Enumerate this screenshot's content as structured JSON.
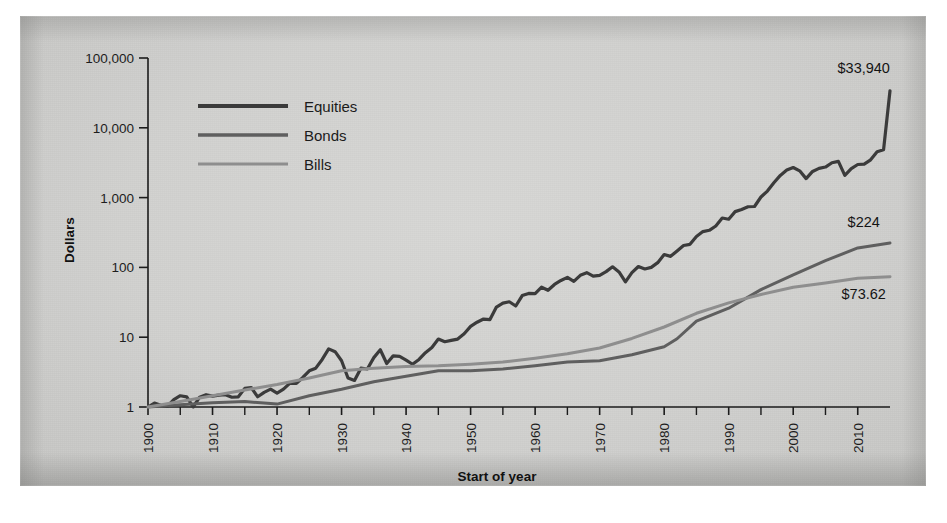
{
  "chart_data": {
    "type": "line",
    "title": "",
    "subtitle": "",
    "xlabel": "Start of year",
    "ylabel": "Dollars",
    "yscale": "log",
    "ylim": [
      1,
      100000
    ],
    "xlim": [
      1900,
      2015
    ],
    "grid": false,
    "legend_position": "upper-left-inside",
    "y_tick_labels": [
      "100,000",
      "10,000",
      "1,000",
      "100",
      "10",
      "1"
    ],
    "y_tick_values": [
      100000,
      10000,
      1000,
      100,
      10,
      1
    ],
    "x_tick_labels": [
      "1900",
      "1910",
      "1920",
      "1930",
      "1940",
      "1950",
      "1960",
      "1970",
      "1980",
      "1990",
      "2000",
      "2010"
    ],
    "x_tick_values": [
      1900,
      1910,
      1920,
      1930,
      1940,
      1950,
      1960,
      1970,
      1980,
      1990,
      2000,
      2010
    ],
    "x_minor_ticks": [
      1905,
      1915,
      1925,
      1935,
      1945,
      1955,
      1965,
      1975,
      1985,
      1995,
      2005
    ],
    "annotations": [
      {
        "label": "$33,940",
        "series": "Equities",
        "x": 2010,
        "value": 33940
      },
      {
        "label": "$224",
        "series": "Bonds",
        "x": 2010,
        "value": 224
      },
      {
        "label": "$73.62",
        "series": "Bills",
        "x": 2010,
        "value": 73.62
      }
    ],
    "series": [
      {
        "name": "Equities",
        "color": "#3b3b3b",
        "width": 3.2,
        "x": [
          1900,
          1901,
          1902,
          1903,
          1904,
          1905,
          1906,
          1907,
          1908,
          1909,
          1910,
          1911,
          1912,
          1913,
          1914,
          1915,
          1916,
          1917,
          1918,
          1919,
          1920,
          1921,
          1922,
          1923,
          1924,
          1925,
          1926,
          1927,
          1928,
          1929,
          1930,
          1931,
          1932,
          1933,
          1934,
          1935,
          1936,
          1937,
          1938,
          1939,
          1940,
          1941,
          1942,
          1943,
          1944,
          1945,
          1946,
          1947,
          1948,
          1949,
          1950,
          1951,
          1952,
          1953,
          1954,
          1955,
          1956,
          1957,
          1958,
          1959,
          1960,
          1961,
          1962,
          1963,
          1964,
          1965,
          1966,
          1967,
          1968,
          1969,
          1970,
          1971,
          1972,
          1973,
          1974,
          1975,
          1976,
          1977,
          1978,
          1979,
          1980,
          1981,
          1982,
          1983,
          1984,
          1985,
          1986,
          1987,
          1988,
          1989,
          1990,
          1991,
          1992,
          1993,
          1994,
          1995,
          1996,
          1997,
          1998,
          1999,
          2000,
          2001,
          2002,
          2003,
          2004,
          2005,
          2006,
          2007,
          2008,
          2009,
          2010,
          2011,
          2012,
          2013,
          2014,
          2015
        ],
        "values": [
          1,
          1.14,
          1.06,
          1.02,
          1.28,
          1.45,
          1.4,
          1.0,
          1.38,
          1.5,
          1.43,
          1.48,
          1.5,
          1.38,
          1.4,
          1.85,
          1.9,
          1.4,
          1.62,
          1.8,
          1.58,
          1.8,
          2.2,
          2.18,
          2.65,
          3.3,
          3.6,
          4.8,
          6.8,
          6.2,
          4.6,
          2.6,
          2.4,
          3.6,
          3.5,
          5.1,
          6.6,
          4.2,
          5.4,
          5.3,
          4.7,
          4.1,
          4.8,
          6.0,
          7.1,
          9.4,
          8.6,
          9.0,
          9.4,
          11.2,
          14.3,
          16.4,
          18.2,
          17.9,
          27.0,
          30.8,
          32.2,
          28.0,
          39.5,
          42.4,
          42.0,
          52.0,
          47.0,
          57.0,
          65.0,
          72.0,
          63.0,
          77.0,
          84.0,
          75.0,
          77.0,
          87.0,
          102.0,
          86.0,
          62.0,
          84.0,
          103.0,
          95.0,
          100.0,
          117.0,
          153.0,
          144.0,
          172.0,
          206.0,
          214.0,
          278.0,
          326.0,
          340.0,
          392.0,
          510.0,
          490.0,
          630.0,
          675.0,
          740.0,
          745.0,
          1020.0,
          1240.0,
          1630.0,
          2080.0,
          2480.0,
          2700.0,
          2420.0,
          1870.0,
          2370.0,
          2620.0,
          2740.0,
          3160.0,
          3300.0,
          2080.0,
          2600.0,
          2980.0,
          3020.0,
          3480.0,
          4550.0,
          4840.0,
          33940
        ]
      },
      {
        "name": "Bonds",
        "color": "#5f5f5f",
        "width": 3.0,
        "x": [
          1900,
          1905,
          1910,
          1915,
          1920,
          1925,
          1930,
          1935,
          1940,
          1945,
          1950,
          1955,
          1960,
          1965,
          1970,
          1975,
          1980,
          1982,
          1985,
          1990,
          1995,
          2000,
          2005,
          2010,
          2015
        ],
        "values": [
          1,
          1.08,
          1.15,
          1.2,
          1.1,
          1.45,
          1.8,
          2.3,
          2.75,
          3.3,
          3.3,
          3.5,
          3.9,
          4.4,
          4.6,
          5.6,
          7.3,
          9.5,
          17.0,
          26.0,
          48.0,
          78.0,
          125.0,
          190.0,
          224
        ]
      },
      {
        "name": "Bills",
        "color": "#8e8e8e",
        "width": 3.0,
        "x": [
          1900,
          1905,
          1910,
          1915,
          1920,
          1925,
          1930,
          1935,
          1940,
          1945,
          1950,
          1955,
          1960,
          1965,
          1970,
          1975,
          1980,
          1985,
          1990,
          1995,
          2000,
          2005,
          2010,
          2015
        ],
        "values": [
          1,
          1.2,
          1.45,
          1.75,
          2.1,
          2.6,
          3.3,
          3.6,
          3.8,
          3.9,
          4.1,
          4.4,
          5.0,
          5.8,
          7.0,
          9.6,
          14.0,
          22.0,
          31.0,
          41.0,
          52.0,
          60.0,
          70.0,
          73.62
        ]
      }
    ]
  },
  "legend": {
    "items": [
      {
        "label": "Equities",
        "color": "#3b3b3b"
      },
      {
        "label": "Bonds",
        "color": "#5f5f5f"
      },
      {
        "label": "Bills",
        "color": "#8e8e8e"
      }
    ]
  },
  "axes": {
    "y_title": "Dollars",
    "x_title": "Start of year"
  }
}
